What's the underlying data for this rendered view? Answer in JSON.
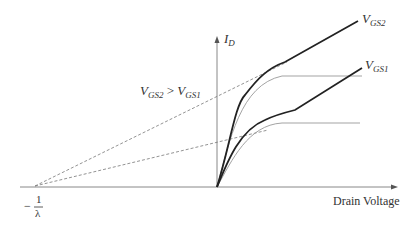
{
  "diagram": {
    "y_axis_label": {
      "main": "I",
      "sub": "D"
    },
    "x_axis_label": "Drain Voltage",
    "curve_labels": [
      {
        "main": "V",
        "sub": "GS2"
      },
      {
        "main": "V",
        "sub": "GS1"
      }
    ],
    "relation": {
      "left_main": "V",
      "left_sub": "GS2",
      "op": ">",
      "right_main": "V",
      "right_sub": "GS1"
    },
    "intercept": {
      "sign": "−",
      "num": "1",
      "den": "λ"
    },
    "colors": {
      "curve": "#222222",
      "ideal": "#999999",
      "dashed": "#777777",
      "axis": "#777777"
    }
  }
}
